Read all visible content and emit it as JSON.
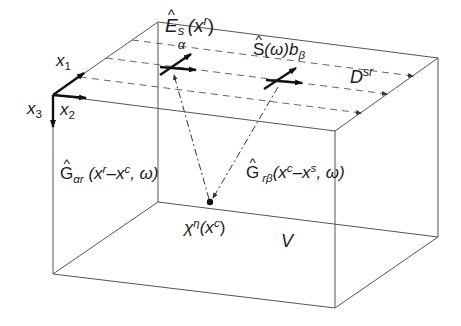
{
  "diagram": {
    "type": "3D volume schematic (inverse scattering / imaging geometry)",
    "colors": {
      "box_edge": "#555555",
      "dashed": "#666666",
      "arrow": "#111111",
      "text": "#1a1a1a"
    },
    "axes": {
      "x1": {
        "base": "x",
        "sub": "1"
      },
      "x2": {
        "base": "x",
        "sub": "2"
      },
      "x3": {
        "base": "x",
        "sub": "3"
      }
    },
    "labels": {
      "receiver_field": {
        "base": "E",
        "sup": "s",
        "sub": "α",
        "arg": "(x",
        "arg_sup": "r",
        "close": ")"
      },
      "source": {
        "base": "S",
        "arg": "(ω)b",
        "sub": "β"
      },
      "data": {
        "base": "D",
        "sup": "sr"
      },
      "green_receiver": {
        "base": "G",
        "sub": "αr",
        "open": " (x",
        "sup1": "r",
        "mid": "–x",
        "sup2": "c",
        "tail": ", ω)"
      },
      "green_source": {
        "base": "G",
        "sub": "rβ",
        "open": "(x",
        "sup1": "c",
        "mid": "–x",
        "sup2": "s",
        "tail": ", ω)"
      },
      "contrast": {
        "base": "χ",
        "sup": "η",
        "open": "(x",
        "arg_sup": "c",
        "close": ")"
      },
      "volume": "V"
    }
  }
}
